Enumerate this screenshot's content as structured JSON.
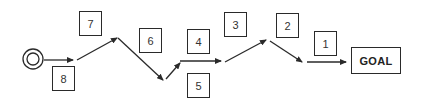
{
  "diagram": {
    "start": {
      "icon": "double-circle-start-icon",
      "cx": 33,
      "cy": 59,
      "r_outer": 10,
      "r_inner": 6
    },
    "steps": [
      {
        "label": "8",
        "x": 52,
        "y": 66
      },
      {
        "label": "7",
        "x": 79,
        "y": 11
      },
      {
        "label": "6",
        "x": 139,
        "y": 28
      },
      {
        "label": "4",
        "x": 187,
        "y": 29
      },
      {
        "label": "5",
        "x": 187,
        "y": 73
      },
      {
        "label": "3",
        "x": 224,
        "y": 12
      },
      {
        "label": "2",
        "x": 276,
        "y": 13
      },
      {
        "label": "1",
        "x": 314,
        "y": 31
      }
    ],
    "goal": {
      "label": "GOAL",
      "x": 351,
      "y": 47,
      "w": 50,
      "h": 27
    },
    "path": [
      {
        "from": [
          44,
          60
        ],
        "to": [
          73,
          60
        ]
      },
      {
        "from": [
          77,
          60
        ],
        "to": [
          117,
          38
        ]
      },
      {
        "from": [
          118,
          38
        ],
        "to": [
          163,
          80
        ]
      },
      {
        "from": [
          166,
          79
        ],
        "to": [
          180,
          63
        ]
      },
      {
        "from": [
          180,
          61
        ],
        "to": [
          221,
          61
        ]
      },
      {
        "from": [
          225,
          62
        ],
        "to": [
          266,
          40
        ]
      },
      {
        "from": [
          270,
          41
        ],
        "to": [
          302,
          62
        ]
      },
      {
        "from": [
          307,
          62
        ],
        "to": [
          346,
          62
        ]
      }
    ],
    "colors": {
      "stroke": "#2a2a2a",
      "background": "#ffffff"
    }
  }
}
